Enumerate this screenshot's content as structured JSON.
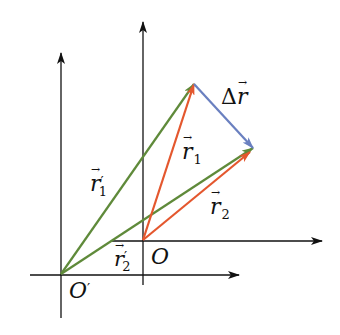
{
  "diagram": {
    "colors": {
      "axis": "#111111",
      "r_vectors": "#E4572E",
      "r_prime_vectors": "#5F8A3A",
      "delta_r": "#6A80C0"
    },
    "points": {
      "O": [
        143,
        240
      ],
      "O_prime": [
        61,
        274
      ],
      "P1": [
        194,
        84
      ],
      "P2": [
        253,
        148
      ]
    },
    "axes": {
      "frame_O": {
        "x_from": [
          112,
          241
        ],
        "x_to": [
          322,
          241
        ],
        "y_from": [
          143,
          285
        ],
        "y_to": [
          143,
          22
        ]
      },
      "frame_O_prime": {
        "x_from": [
          30,
          275
        ],
        "x_to": [
          239,
          275
        ],
        "y_from": [
          61,
          318
        ],
        "y_to": [
          61,
          53
        ]
      }
    },
    "labels": {
      "O": "O",
      "O_prime": "O",
      "prime_mark": "′",
      "r1": "r",
      "r1_sub": "1",
      "r2": "r",
      "r2_sub": "2",
      "r1_prime": "r",
      "r1_prime_sub": "1",
      "r2_prime": "r",
      "r2_prime_sub": "2",
      "delta_r_symbol": "Δ",
      "delta_r": "r",
      "vector_arrow": "→"
    }
  }
}
